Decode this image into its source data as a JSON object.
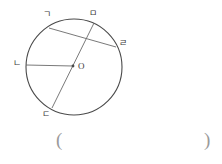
{
  "figure": {
    "type": "circle-geometry-diagram",
    "circle": {
      "center_label": "O",
      "cx": 74,
      "cy": 67,
      "r": 48,
      "stroke": "#4a4a4a"
    },
    "points": [
      {
        "id": "g",
        "label": "ㄱ",
        "x": 49,
        "y": 28,
        "label_x": 45,
        "label_y": 12
      },
      {
        "id": "m",
        "label": "ㅁ",
        "x": 94,
        "y": 23,
        "label_x": 90,
        "label_y": 11
      },
      {
        "id": "r",
        "label": "ㄹ",
        "x": 116,
        "y": 47,
        "label_x": 120,
        "label_y": 41
      },
      {
        "id": "n",
        "label": "ㄴ",
        "x": 26,
        "y": 65,
        "label_x": 14,
        "label_y": 60
      },
      {
        "id": "d",
        "label": "ㄷ",
        "x": 52,
        "y": 108,
        "label_x": 43,
        "label_y": 112
      }
    ],
    "segments": [
      {
        "name": "chord-g-r",
        "from": "g",
        "to": "r"
      },
      {
        "name": "diameter-m-d",
        "from": "m",
        "to": "d"
      },
      {
        "name": "radius-n-o",
        "from": "n",
        "to": "center"
      }
    ],
    "center_label_pos": {
      "x": 78,
      "y": 62
    }
  },
  "answer": {
    "open_paren": "(",
    "close_paren": ")",
    "value": ""
  }
}
